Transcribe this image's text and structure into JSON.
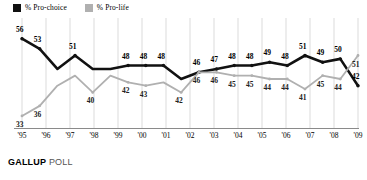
{
  "legend": {
    "items": [
      {
        "label": "% Pro-choice",
        "color": "#111111",
        "icon": "square-swatch"
      },
      {
        "label": "% Pro-life",
        "color": "#b0b0b0",
        "icon": "square-swatch"
      }
    ]
  },
  "footer": {
    "brand": "GALLUP",
    "suffix": "POLL"
  },
  "chart_data": {
    "type": "line",
    "title": "",
    "xlabel": "",
    "ylabel": "",
    "ylim": [
      30,
      58
    ],
    "grid": true,
    "legend_position": "top-left",
    "x": [
      "'95",
      "'96",
      "'97",
      "'98",
      "'98",
      "'98",
      "'99",
      "'00",
      "'01",
      "'01",
      "'01",
      "'02",
      "'03",
      "'04",
      "'05",
      "'06",
      "'07",
      "'08",
      "'09",
      "'09"
    ],
    "xticks": [
      "'95",
      "'96",
      "'97",
      "'98",
      "'99",
      "'00",
      "'01",
      "'02",
      "'03",
      "'04",
      "'05",
      "'06",
      "'07",
      "'08",
      "'09"
    ],
    "series": [
      {
        "name": "% Pro-choice",
        "color": "#111111",
        "values": [
          56,
          53,
          47,
          51,
          47,
          47,
          48,
          48,
          48,
          44,
          46,
          47,
          48,
          48,
          49,
          48,
          51,
          49,
          50,
          42
        ],
        "labels": [
          {
            "i": 0,
            "text": "56"
          },
          {
            "i": 1,
            "text": "53"
          },
          {
            "i": 3,
            "text": "51"
          },
          {
            "i": 6,
            "text": "48"
          },
          {
            "i": 7,
            "text": "48"
          },
          {
            "i": 8,
            "text": "48"
          },
          {
            "i": 10,
            "text": "46"
          },
          {
            "i": 11,
            "text": "47"
          },
          {
            "i": 12,
            "text": "48"
          },
          {
            "i": 13,
            "text": "48"
          },
          {
            "i": 14,
            "text": "49"
          },
          {
            "i": 15,
            "text": "48"
          },
          {
            "i": 16,
            "text": "51"
          },
          {
            "i": 17,
            "text": "49"
          },
          {
            "i": 18,
            "text": "50"
          },
          {
            "i": 19,
            "text": "42"
          }
        ]
      },
      {
        "name": "% Pro-life",
        "color": "#b0b0b0",
        "values": [
          33,
          36,
          42,
          45,
          40,
          45,
          43,
          42,
          43,
          40,
          46,
          46,
          45,
          45,
          44,
          44,
          41,
          45,
          44,
          51
        ],
        "labels": [
          {
            "i": 0,
            "text": "33"
          },
          {
            "i": 1,
            "text": "36"
          },
          {
            "i": 4,
            "text": "40"
          },
          {
            "i": 6,
            "text": "42"
          },
          {
            "i": 7,
            "text": "43"
          },
          {
            "i": 9,
            "text": "42"
          },
          {
            "i": 10,
            "text": "46"
          },
          {
            "i": 11,
            "text": "46"
          },
          {
            "i": 12,
            "text": "45"
          },
          {
            "i": 13,
            "text": "45"
          },
          {
            "i": 14,
            "text": "44"
          },
          {
            "i": 15,
            "text": "44"
          },
          {
            "i": 16,
            "text": "41"
          },
          {
            "i": 17,
            "text": "45"
          },
          {
            "i": 18,
            "text": "44"
          },
          {
            "i": 19,
            "text": "51"
          }
        ]
      }
    ]
  }
}
